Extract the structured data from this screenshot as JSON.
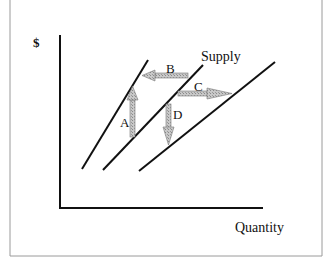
{
  "diagram": {
    "y_axis_label": "$",
    "x_axis_label": "Quantity",
    "curve_label": "Supply",
    "arrows": [
      {
        "label": "A",
        "direction": "up"
      },
      {
        "label": "B",
        "direction": "left"
      },
      {
        "label": "C",
        "direction": "right"
      },
      {
        "label": "D",
        "direction": "down"
      }
    ],
    "curves": [
      {
        "name": "supply-left-shift",
        "from": [
          82,
          169
        ],
        "to": [
          148,
          60
        ]
      },
      {
        "name": "supply-original",
        "from": [
          103,
          170
        ],
        "to": [
          203,
          65
        ]
      },
      {
        "name": "supply-right-shift",
        "from": [
          139,
          171
        ],
        "to": [
          275,
          62
        ]
      }
    ],
    "colors": {
      "line": "#111111",
      "arrow_fill": "#bdbdbd",
      "border": "#9a9a9a"
    }
  }
}
